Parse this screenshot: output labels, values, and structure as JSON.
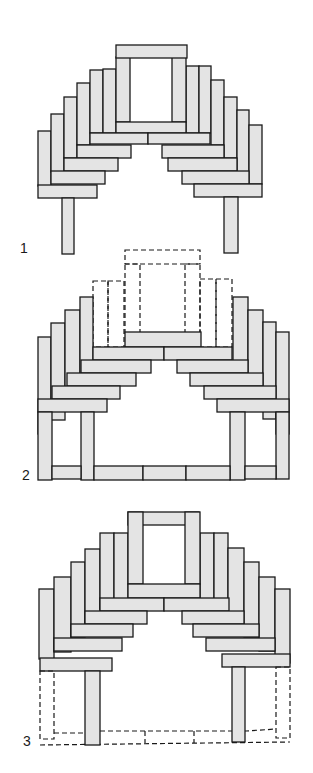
{
  "figure": {
    "type": "diagram",
    "fill_color": "#e4e4e4",
    "stroke_color": "#1a1a1a",
    "panels": [
      {
        "label": "1",
        "description": "corbelled arch with central lintel opening on two posts"
      },
      {
        "label": "2",
        "description": "arch with top section removed (dashed), on frame with posts and bottom sill beams"
      },
      {
        "label": "3",
        "description": "full arch on two posts with dashed outline of earlier base frame"
      }
    ]
  }
}
